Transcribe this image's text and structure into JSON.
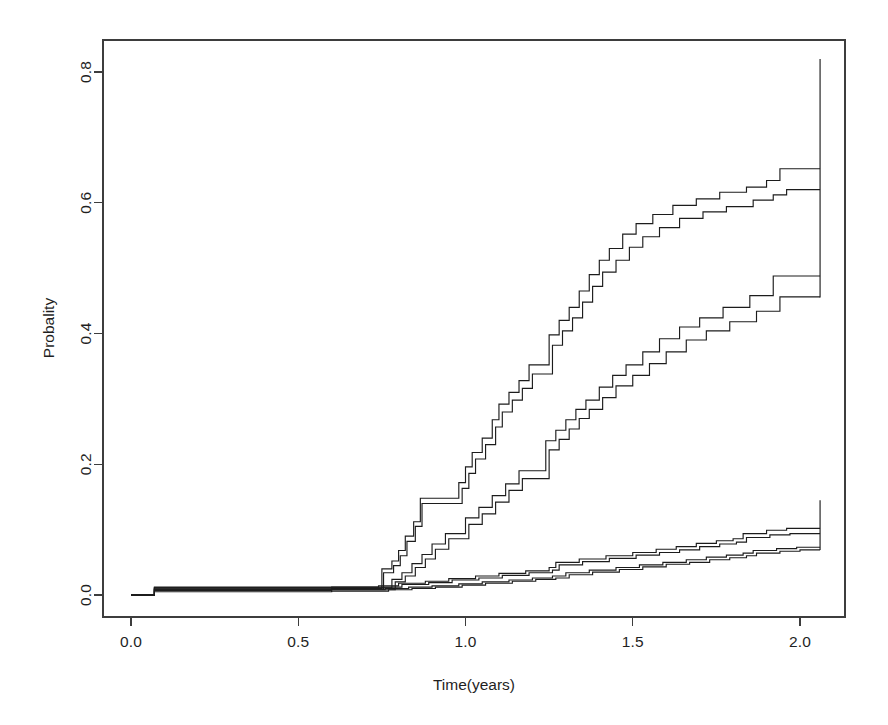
{
  "chart_data": {
    "type": "line",
    "subtype": "step-function-cumulative-incidence-with-confidence-bands",
    "title": "",
    "xlabel": "Time(years)",
    "ylabel": "Probality",
    "xlim": [
      -0.06,
      2.18
    ],
    "ylim": [
      -0.02,
      0.855
    ],
    "grid": false,
    "legend": null,
    "xticks": [
      0.0,
      0.5,
      1.0,
      1.5,
      2.0
    ],
    "xtick_labels": [
      "0.0",
      "0.5",
      "1.0",
      "1.5",
      "2.0"
    ],
    "yticks": [
      0.0,
      0.2,
      0.4,
      0.6,
      0.8
    ],
    "ytick_labels": [
      "0.0",
      "0.2",
      "0.4",
      "0.6",
      "0.8"
    ],
    "annotations": [
      {
        "name": "terminal-vertical-upper",
        "x": 2.06,
        "y0": 0.455,
        "y1": 0.82
      },
      {
        "name": "terminal-vertical-lower",
        "x": 2.06,
        "y0": 0.069,
        "y1": 0.145
      }
    ],
    "series": [
      {
        "name": "group-A-upper-confidence-limit",
        "band": "upper-band",
        "role": "upper",
        "x": [
          0.0,
          0.07,
          0.73,
          0.75,
          0.78,
          0.8,
          0.82,
          0.845,
          0.865,
          0.95,
          0.98,
          1.0,
          1.02,
          1.05,
          1.08,
          1.1,
          1.13,
          1.16,
          1.19,
          1.22,
          1.25,
          1.28,
          1.31,
          1.34,
          1.37,
          1.4,
          1.43,
          1.47,
          1.51,
          1.56,
          1.62,
          1.69,
          1.76,
          1.84,
          1.9,
          1.94,
          2.06
        ],
        "y": [
          0.0,
          0.012,
          0.012,
          0.04,
          0.052,
          0.068,
          0.09,
          0.112,
          0.148,
          0.148,
          0.172,
          0.196,
          0.218,
          0.24,
          0.268,
          0.292,
          0.31,
          0.328,
          0.352,
          0.352,
          0.398,
          0.42,
          0.44,
          0.465,
          0.49,
          0.512,
          0.53,
          0.552,
          0.568,
          0.582,
          0.596,
          0.606,
          0.616,
          0.624,
          0.634,
          0.652,
          0.652
        ]
      },
      {
        "name": "group-A-point-estimate",
        "band": "upper-band",
        "role": "estimate",
        "x": [
          0.0,
          0.07,
          0.73,
          0.755,
          0.785,
          0.805,
          0.825,
          0.85,
          0.87,
          0.96,
          0.99,
          1.01,
          1.03,
          1.06,
          1.09,
          1.11,
          1.14,
          1.17,
          1.2,
          1.23,
          1.26,
          1.29,
          1.32,
          1.35,
          1.38,
          1.41,
          1.45,
          1.49,
          1.53,
          1.58,
          1.64,
          1.71,
          1.78,
          1.86,
          1.92,
          1.96,
          2.06
        ],
        "y": [
          0.0,
          0.009,
          0.009,
          0.034,
          0.045,
          0.06,
          0.082,
          0.105,
          0.14,
          0.14,
          0.163,
          0.186,
          0.208,
          0.23,
          0.257,
          0.28,
          0.298,
          0.316,
          0.338,
          0.338,
          0.382,
          0.404,
          0.424,
          0.448,
          0.472,
          0.494,
          0.512,
          0.532,
          0.548,
          0.562,
          0.576,
          0.586,
          0.594,
          0.604,
          0.612,
          0.62,
          0.62
        ]
      },
      {
        "name": "group-B-upper-confidence-limit",
        "band": "middle-band",
        "role": "upper",
        "x": [
          0.0,
          0.07,
          0.74,
          0.78,
          0.81,
          0.84,
          0.87,
          0.9,
          0.94,
          0.97,
          1.0,
          1.04,
          1.08,
          1.12,
          1.16,
          1.2,
          1.24,
          1.27,
          1.3,
          1.33,
          1.36,
          1.4,
          1.44,
          1.48,
          1.53,
          1.58,
          1.64,
          1.7,
          1.77,
          1.85,
          1.92,
          2.06
        ],
        "y": [
          0.0,
          0.011,
          0.011,
          0.024,
          0.034,
          0.048,
          0.062,
          0.078,
          0.094,
          0.094,
          0.118,
          0.134,
          0.152,
          0.17,
          0.19,
          0.19,
          0.236,
          0.252,
          0.268,
          0.284,
          0.298,
          0.318,
          0.336,
          0.352,
          0.372,
          0.392,
          0.41,
          0.424,
          0.44,
          0.458,
          0.488,
          0.488
        ]
      },
      {
        "name": "group-B-point-estimate",
        "band": "middle-band",
        "role": "estimate",
        "x": [
          0.0,
          0.07,
          0.74,
          0.79,
          0.82,
          0.85,
          0.88,
          0.91,
          0.95,
          0.98,
          1.01,
          1.05,
          1.09,
          1.13,
          1.17,
          1.21,
          1.25,
          1.28,
          1.31,
          1.34,
          1.37,
          1.41,
          1.45,
          1.5,
          1.55,
          1.6,
          1.66,
          1.72,
          1.79,
          1.87,
          1.94,
          2.06
        ],
        "y": [
          0.0,
          0.008,
          0.008,
          0.02,
          0.029,
          0.042,
          0.055,
          0.07,
          0.086,
          0.086,
          0.108,
          0.124,
          0.142,
          0.16,
          0.178,
          0.178,
          0.222,
          0.238,
          0.254,
          0.27,
          0.284,
          0.302,
          0.32,
          0.336,
          0.354,
          0.372,
          0.39,
          0.404,
          0.418,
          0.434,
          0.456,
          0.456
        ]
      },
      {
        "name": "group-C-upper-confidence-limit",
        "band": "lower-band",
        "role": "upper",
        "x": [
          0.0,
          0.07,
          0.6,
          0.74,
          0.8,
          0.88,
          0.95,
          1.03,
          1.1,
          1.18,
          1.25,
          1.27,
          1.34,
          1.42,
          1.5,
          1.57,
          1.63,
          1.69,
          1.75,
          1.8,
          1.83,
          1.9,
          1.96,
          2.06
        ],
        "y": [
          0.0,
          0.011,
          0.012,
          0.014,
          0.018,
          0.021,
          0.025,
          0.029,
          0.033,
          0.037,
          0.042,
          0.05,
          0.055,
          0.06,
          0.065,
          0.07,
          0.074,
          0.079,
          0.083,
          0.086,
          0.094,
          0.099,
          0.102,
          0.102
        ]
      },
      {
        "name": "group-C-point-estimate",
        "band": "lower-band",
        "role": "estimate",
        "x": [
          0.0,
          0.07,
          0.6,
          0.75,
          0.81,
          0.89,
          0.96,
          1.04,
          1.11,
          1.19,
          1.26,
          1.28,
          1.35,
          1.43,
          1.51,
          1.58,
          1.64,
          1.7,
          1.76,
          1.81,
          1.84,
          1.91,
          1.97,
          2.06
        ],
        "y": [
          0.0,
          0.009,
          0.01,
          0.012,
          0.016,
          0.019,
          0.023,
          0.026,
          0.03,
          0.034,
          0.038,
          0.046,
          0.051,
          0.056,
          0.061,
          0.065,
          0.069,
          0.074,
          0.078,
          0.081,
          0.088,
          0.092,
          0.094,
          0.094
        ]
      },
      {
        "name": "group-D-upper-confidence-limit",
        "band": "lower-band",
        "role": "upper",
        "x": [
          0.0,
          0.07,
          0.6,
          0.76,
          0.83,
          0.9,
          0.98,
          1.05,
          1.13,
          1.2,
          1.26,
          1.3,
          1.37,
          1.45,
          1.52,
          1.59,
          1.66,
          1.72,
          1.78,
          1.83,
          1.86,
          1.93,
          1.99,
          2.06
        ],
        "y": [
          0.0,
          0.007,
          0.008,
          0.01,
          0.012,
          0.014,
          0.017,
          0.02,
          0.023,
          0.026,
          0.029,
          0.034,
          0.038,
          0.042,
          0.046,
          0.05,
          0.054,
          0.058,
          0.061,
          0.064,
          0.068,
          0.071,
          0.073,
          0.073
        ]
      },
      {
        "name": "group-D-point-estimate",
        "band": "lower-band",
        "role": "estimate",
        "x": [
          0.0,
          0.07,
          0.6,
          0.77,
          0.84,
          0.91,
          0.99,
          1.06,
          1.14,
          1.21,
          1.27,
          1.31,
          1.38,
          1.46,
          1.53,
          1.6,
          1.67,
          1.73,
          1.79,
          1.84,
          1.87,
          1.94,
          2.0,
          2.06
        ],
        "y": [
          0.0,
          0.005,
          0.006,
          0.008,
          0.01,
          0.012,
          0.015,
          0.018,
          0.021,
          0.024,
          0.026,
          0.031,
          0.035,
          0.039,
          0.043,
          0.047,
          0.05,
          0.054,
          0.057,
          0.06,
          0.064,
          0.067,
          0.069,
          0.069
        ]
      }
    ]
  },
  "axes": {
    "x_title": "Time(years)",
    "y_title": "Probality"
  }
}
